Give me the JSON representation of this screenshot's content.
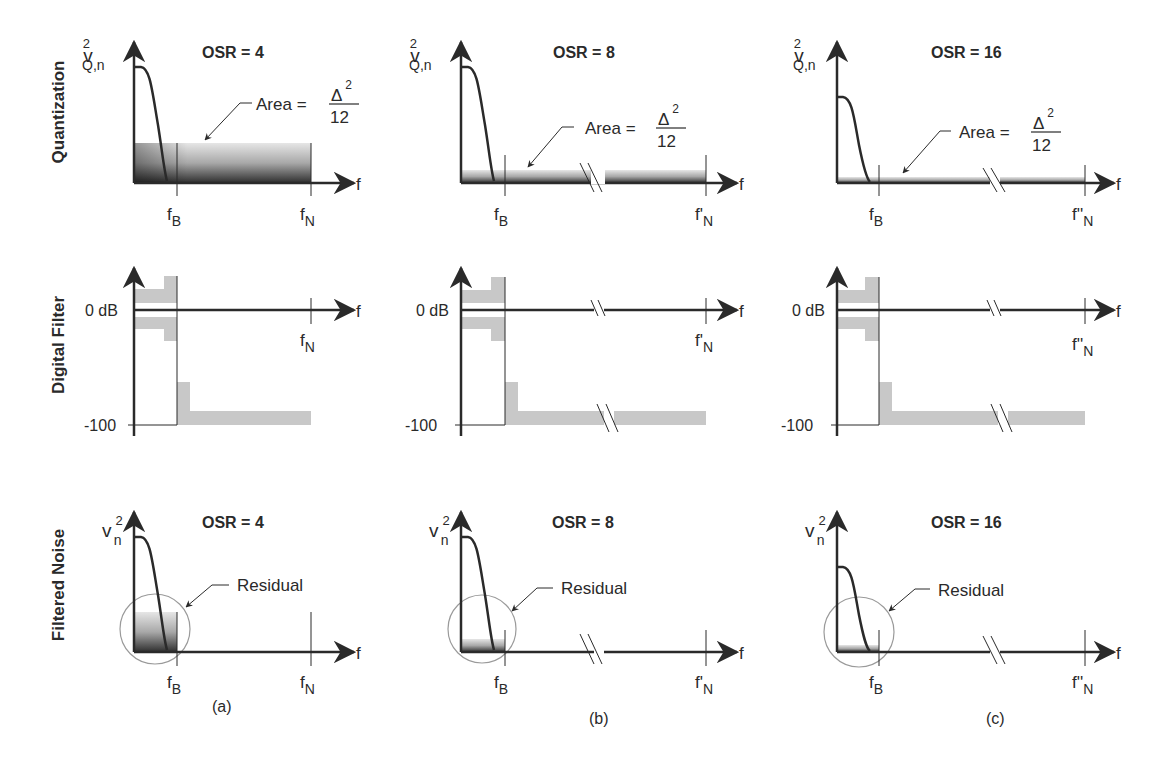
{
  "figure": {
    "row_labels": [
      "Quantization",
      "Digital Filter",
      "Filtered Noise"
    ],
    "columns": [
      {
        "caption": "(a)",
        "osr_label": "OSR = 4",
        "nyquist_label_base": "f",
        "nyquist_label_prime": "",
        "nyquist_label_sub": "N",
        "has_axis_break": false
      },
      {
        "caption": "(b)",
        "osr_label": "OSR = 8",
        "nyquist_label_base": "f",
        "nyquist_label_prime": "'",
        "nyquist_label_sub": "N",
        "has_axis_break": true
      },
      {
        "caption": "(c)",
        "osr_label": "OSR = 16",
        "nyquist_label_base": "f",
        "nyquist_label_prime": "''",
        "nyquist_label_sub": "N",
        "has_axis_break": true
      }
    ],
    "quantization": {
      "ylabel_base": "v",
      "ylabel_sup": "2",
      "ylabel_sub": "Q,n",
      "area_label": "Area =",
      "area_num": "Δ",
      "area_num_sup": "2",
      "area_den": "12"
    },
    "digital_filter": {
      "tick_0": "0 dB",
      "tick_min": "-100"
    },
    "filtered_noise": {
      "ylabel_base": "v",
      "ylabel_sup": "2",
      "ylabel_sub": "n",
      "residual_label": "Residual"
    },
    "axis": {
      "x_label": "f",
      "fb_base": "f",
      "fb_sub": "B"
    }
  },
  "colors": {
    "ink": "#2a2a2a",
    "shade": "#c8c8c8",
    "shade_dark": "#3a3a3a",
    "circle": "#9a9a9a"
  }
}
